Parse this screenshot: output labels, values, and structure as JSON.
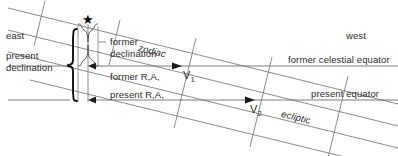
{
  "diagram": {
    "background_color": "#ffffff",
    "line_color": "#6e6e6e",
    "heavy_line_color": "#1a1a1a",
    "text_color": "#2b2b2b"
  },
  "labels": {
    "east": "east",
    "west": "west",
    "present_declination": "present\ndeclination",
    "present_declination_line1": "present",
    "present_declination_line2": "declination",
    "former_declination_line1": "former",
    "former_declination_line2": "declination",
    "former_right_ascension": "former R,A,",
    "present_right_ascension": "present R,A,",
    "former_celestial_equator": "former celestial equator",
    "present_equator": "present equator",
    "zodiac": "zodiac",
    "ecliptic": "ecliptic",
    "vernal_point_former": "V",
    "vernal_point_former_sub": "1",
    "vernal_point_present": "V",
    "vernal_point_present_sub": "2"
  },
  "markers": {
    "star_glyph": "★",
    "star_name": "star-marker"
  }
}
